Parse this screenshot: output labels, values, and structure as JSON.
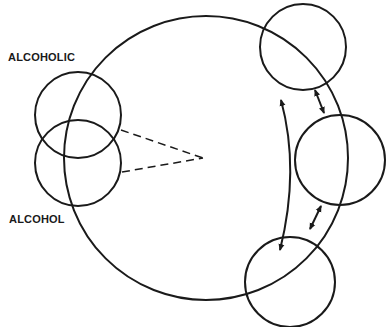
{
  "labels": {
    "top_left": "ALCOHOLIC",
    "bottom_left": "ALCOHOL"
  },
  "diagram": {
    "stroke_color": "#1a1a1a",
    "background": "#ffffff",
    "big_circle": {
      "cx": 206,
      "cy": 158,
      "r": 142
    },
    "small_circles": [
      {
        "name": "alcoholic-circle",
        "cx": 78,
        "cy": 115,
        "r": 43
      },
      {
        "name": "alcohol-circle",
        "cx": 78,
        "cy": 163,
        "r": 43
      },
      {
        "name": "top-right-circle",
        "cx": 303,
        "cy": 47,
        "r": 43
      },
      {
        "name": "middle-right-circle",
        "cx": 340,
        "cy": 160,
        "r": 45
      },
      {
        "name": "bottom-right-circle",
        "cx": 290,
        "cy": 282,
        "r": 45
      }
    ],
    "dashed_lines": "two dashed lines converging from left circles to center point",
    "arrows": "three double-headed arrows between right-side circles"
  }
}
